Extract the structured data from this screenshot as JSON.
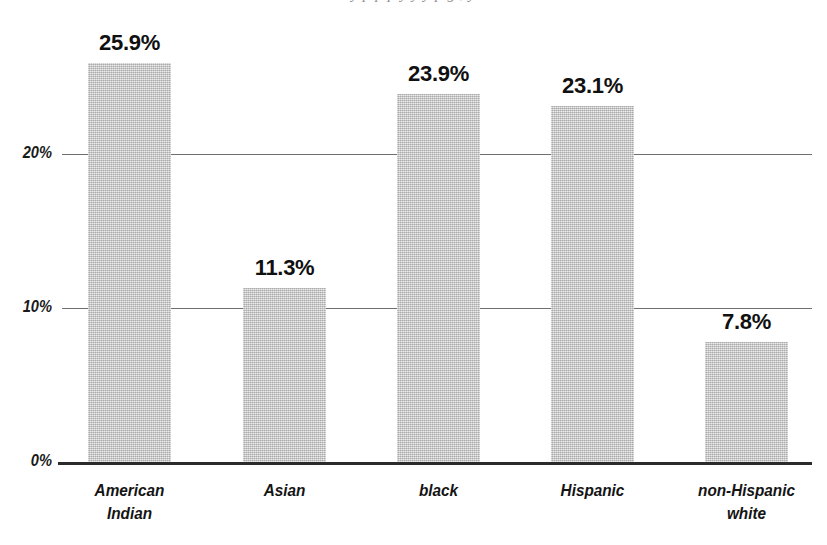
{
  "figure": {
    "cropped_caption": "y  p  p       p   y        y          y                  p        g ,                              y"
  },
  "chart_data": {
    "type": "bar",
    "title": "",
    "xlabel": "",
    "ylabel": "",
    "categories": [
      "American\nIndian",
      "Asian",
      "black",
      "Hispanic",
      "non-Hispanic\nwhite"
    ],
    "values": [
      25.9,
      11.3,
      23.9,
      23.1,
      7.8
    ],
    "data_labels": [
      "25.9%",
      "11.3%",
      "23.9%",
      "23.1%",
      "7.8%"
    ],
    "ylim": [
      0,
      30
    ],
    "yticks": [
      0,
      10,
      20
    ],
    "ytick_labels": [
      "0%",
      "10%",
      "20%"
    ],
    "grid": true,
    "gridlines_at": [
      10,
      20
    ],
    "legend": null,
    "series": [
      {
        "name": "percent",
        "values": [
          25.9,
          11.3,
          23.9,
          23.1,
          7.8
        ]
      }
    ],
    "colors": {
      "bar_fill": "#c2c2c2",
      "axis": "#2b2b2b",
      "gridline": "#6f6f6f",
      "text": "#101010"
    }
  }
}
